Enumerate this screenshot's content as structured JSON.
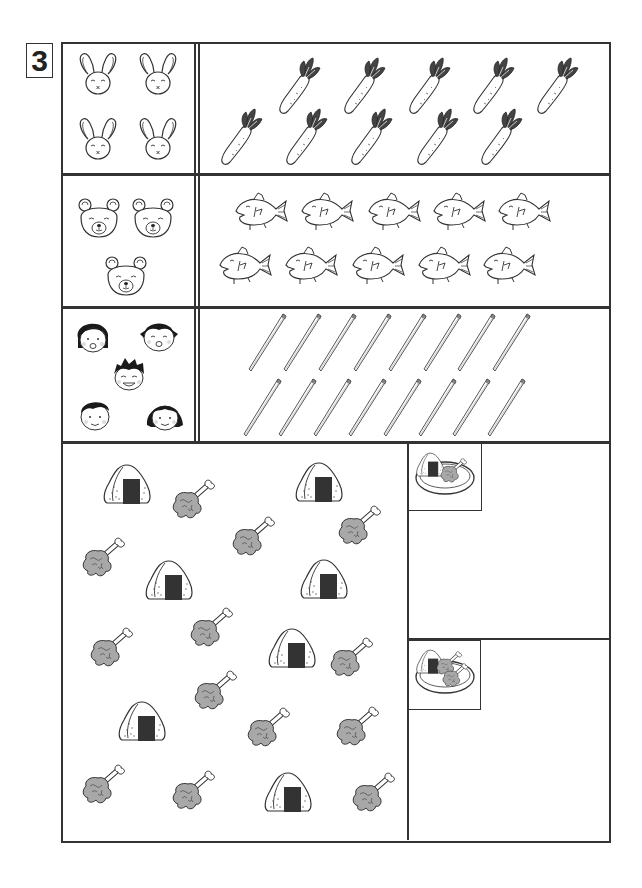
{
  "worksheet": {
    "problem_number": "3",
    "colors": {
      "line": "#333333",
      "meat": "#a8a8a8",
      "nori": "#333333",
      "carrot_leaves": "#444444",
      "hair": "#1a1a1a",
      "background": "#ffffff"
    },
    "rows": [
      {
        "name": "bunnies-carrots",
        "left": {
          "item": "bunny",
          "icon": "bunny-icon",
          "count": 4
        },
        "right": {
          "item": "carrot",
          "icon": "carrot-icon",
          "count": 10
        }
      },
      {
        "name": "bears-fish",
        "left": {
          "item": "bear",
          "icon": "bear-icon",
          "count": 3
        },
        "right": {
          "item": "fish",
          "icon": "fish-icon",
          "count": 10
        }
      },
      {
        "name": "children-chopsticks",
        "left": {
          "item": "child",
          "icon": "child-face-icon",
          "count": 5
        },
        "right": {
          "item": "chopstick",
          "icon": "chopstick-icon",
          "count": 16
        }
      }
    ],
    "food_area": {
      "onigiri": {
        "icon": "onigiri-icon",
        "count": 7
      },
      "drumstick": {
        "icon": "drumstick-icon",
        "count": 13
      }
    },
    "plate_sets": [
      {
        "name": "plate-set-1",
        "icon": "plate-onigiri-drumstick-icon",
        "onigiri": 1,
        "drumsticks": 1
      },
      {
        "name": "plate-set-2",
        "icon": "plate-onigiri-two-drumsticks-icon",
        "onigiri": 1,
        "drumsticks": 2
      }
    ]
  }
}
